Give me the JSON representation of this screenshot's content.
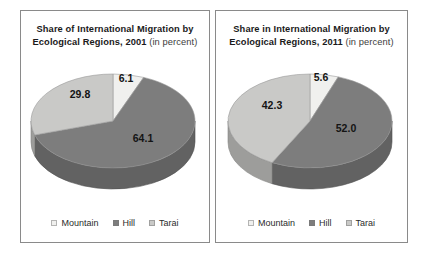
{
  "figure": {
    "panels": [
      {
        "title_main": "Share of International Migration by Ecological Regions, 2001",
        "title_suffix": " (in percent)",
        "legend": [
          {
            "label": "Mountain",
            "color": "#f0f0ee"
          },
          {
            "label": "Hill",
            "color": "#7d7d7d"
          },
          {
            "label": "Tarai",
            "color": "#c9c9c7"
          }
        ],
        "chart_data": {
          "type": "pie",
          "title": "Share of International Migration by Ecological Regions, 2001 (in percent)",
          "categories": [
            "Mountain",
            "Hill",
            "Tarai"
          ],
          "values": [
            6.1,
            64.1,
            29.8
          ],
          "labels": [
            "6.1",
            "64.1",
            "29.8"
          ],
          "colors": [
            "#f0f0ee",
            "#7d7d7d",
            "#c9c9c7"
          ],
          "units": "percent",
          "legend_position": "bottom",
          "three_d": true
        }
      },
      {
        "title_main": "Share in International Migration by Ecological Regions, 2011",
        "title_suffix": " (in percent)",
        "legend": [
          {
            "label": "Mountain",
            "color": "#f0f0ee"
          },
          {
            "label": "Hill",
            "color": "#7d7d7d"
          },
          {
            "label": "Tarai",
            "color": "#c9c9c7"
          }
        ],
        "chart_data": {
          "type": "pie",
          "title": "Share in International Migration by Ecological Regions, 2011 (in percent)",
          "categories": [
            "Mountain",
            "Hill",
            "Tarai"
          ],
          "values": [
            5.6,
            52.0,
            42.3
          ],
          "labels": [
            "5.6",
            "52.0",
            "42.3"
          ],
          "colors": [
            "#f0f0ee",
            "#7d7d7d",
            "#c9c9c7"
          ],
          "units": "percent",
          "legend_position": "bottom",
          "three_d": true
        }
      }
    ]
  }
}
